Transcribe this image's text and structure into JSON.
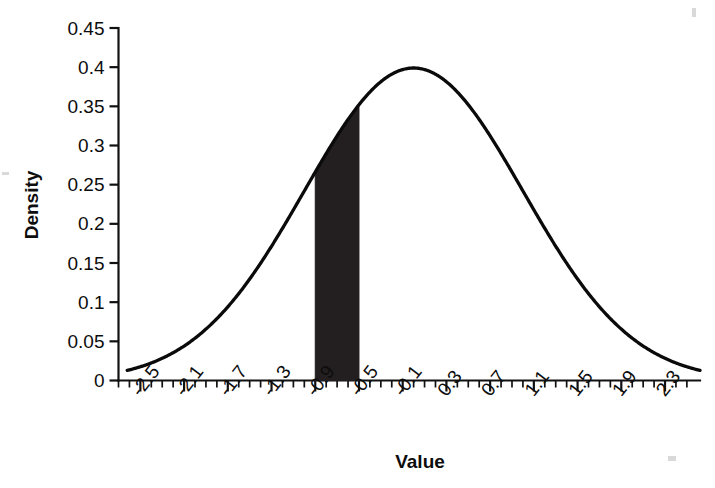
{
  "chart_data": {
    "type": "line",
    "title": "",
    "subtitle": "",
    "xlabel": "Value",
    "ylabel": "Density",
    "xlim": [
      -2.7,
      2.5
    ],
    "ylim": [
      0,
      0.45
    ],
    "grid": false,
    "legend": null,
    "x_tick_labels": [
      "-2.5",
      "-2.1",
      "-1.7",
      "-1.3",
      "-0.9",
      "-0.5",
      "-0.1",
      "0.3",
      "0.7",
      "1.1",
      "1.5",
      "1.9",
      "2.3"
    ],
    "x_tick_values": [
      -2.5,
      -2.1,
      -1.7,
      -1.3,
      -0.9,
      -0.5,
      -0.1,
      0.3,
      0.7,
      1.1,
      1.5,
      1.9,
      2.3
    ],
    "x_minor_tick_step": 0.1,
    "y_tick_labels": [
      "0",
      "0.05",
      "0.1",
      "0.15",
      "0.2",
      "0.25",
      "0.3",
      "0.35",
      "0.4",
      "0.45"
    ],
    "y_tick_values": [
      0,
      0.05,
      0.1,
      0.15,
      0.2,
      0.25,
      0.3,
      0.35,
      0.4,
      0.45
    ],
    "series": [
      {
        "name": "Density",
        "color": "#0a0a0a",
        "x": [
          -2.7,
          -2.6,
          -2.5,
          -2.4,
          -2.3,
          -2.2,
          -2.1,
          -2.0,
          -1.9,
          -1.8,
          -1.7,
          -1.6,
          -1.5,
          -1.4,
          -1.3,
          -1.2,
          -1.1,
          -1.0,
          -0.9,
          -0.8,
          -0.7,
          -0.6,
          -0.5,
          -0.4,
          -0.3,
          -0.2,
          -0.1,
          0.0,
          0.1,
          0.2,
          0.3,
          0.4,
          0.5,
          0.6,
          0.7,
          0.8,
          0.9,
          1.0,
          1.1,
          1.2,
          1.3,
          1.4,
          1.5,
          1.6,
          1.7,
          1.8,
          1.9,
          2.0,
          2.1,
          2.2,
          2.3,
          2.4,
          2.5
        ],
        "y": [
          0.0104,
          0.0136,
          0.0175,
          0.0224,
          0.0283,
          0.0355,
          0.044,
          0.054,
          0.0656,
          0.079,
          0.094,
          0.1109,
          0.1295,
          0.1497,
          0.1714,
          0.1942,
          0.2179,
          0.242,
          0.2661,
          0.2897,
          0.3123,
          0.3332,
          0.3521,
          0.3683,
          0.3814,
          0.391,
          0.397,
          0.3989,
          0.397,
          0.391,
          0.3814,
          0.3683,
          0.3521,
          0.3332,
          0.3123,
          0.2897,
          0.2661,
          0.242,
          0.2179,
          0.1942,
          0.1714,
          0.1497,
          0.1295,
          0.1109,
          0.094,
          0.079,
          0.0656,
          0.054,
          0.044,
          0.0355,
          0.0283,
          0.0224,
          0.0175
        ]
      }
    ],
    "shaded_region": {
      "x_start": -0.9,
      "x_end": -0.5,
      "y_start": 0.2661,
      "y_end": 0.3521,
      "color": "#231f20"
    },
    "peak": {
      "x": 0.0,
      "y": 0.4
    }
  }
}
